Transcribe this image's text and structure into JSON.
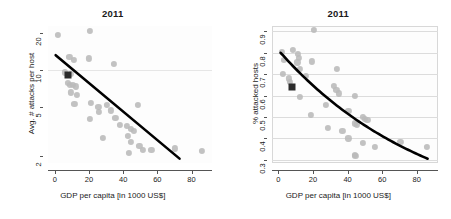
{
  "figure": {
    "width": 451,
    "height": 219,
    "background": "#ffffff",
    "dot_color": "#b9b9b9",
    "highlight_color": "#2b2b2b",
    "trend_color": "#000000",
    "grid_color": "#dcdcdc"
  },
  "chart_data": [
    {
      "type": "scatter",
      "id": "left",
      "title": "2011",
      "xlabel": "GDP per capita [in 1000 US$]",
      "ylabel": "Avg. # attacks per host",
      "xscale": "linear",
      "yscale": "log",
      "xlim": [
        -4,
        92
      ],
      "ylim": [
        1.75,
        23
      ],
      "xticks": [
        0,
        20,
        40,
        60,
        80
      ],
      "xticklabels": [
        "0",
        "20",
        "40",
        "60",
        "80"
      ],
      "yticks": [
        2,
        5,
        10,
        20
      ],
      "yticklabels": [
        "2",
        "5",
        "10",
        "20"
      ],
      "gridlines_y": [
        10
      ],
      "grid": "single horizontal gridline at y=10",
      "legend": null,
      "points": [
        {
          "x": 1.8,
          "y": 19.5
        },
        {
          "x": 20.5,
          "y": 21.0
        },
        {
          "x": 8.5,
          "y": 12.8
        },
        {
          "x": 11.0,
          "y": 12.2
        },
        {
          "x": 20.0,
          "y": 12.5
        },
        {
          "x": 34.5,
          "y": 11.2
        },
        {
          "x": 6.0,
          "y": 9.6
        },
        {
          "x": 9.5,
          "y": 9.3
        },
        {
          "x": 7.5,
          "y": 7.9
        },
        {
          "x": 9.0,
          "y": 7.6
        },
        {
          "x": 10.5,
          "y": 7.6
        },
        {
          "x": 12.5,
          "y": 7.4
        },
        {
          "x": 9.5,
          "y": 6.6
        },
        {
          "x": 13.0,
          "y": 6.3
        },
        {
          "x": 11.5,
          "y": 5.3
        },
        {
          "x": 21.0,
          "y": 5.4
        },
        {
          "x": 25.5,
          "y": 5.0
        },
        {
          "x": 30.5,
          "y": 5.2
        },
        {
          "x": 33.0,
          "y": 4.7
        },
        {
          "x": 48.5,
          "y": 5.2
        },
        {
          "x": 26.0,
          "y": 4.6
        },
        {
          "x": 20.5,
          "y": 4.0
        },
        {
          "x": 35.5,
          "y": 4.1
        },
        {
          "x": 38.0,
          "y": 3.6
        },
        {
          "x": 42.0,
          "y": 3.5
        },
        {
          "x": 44.5,
          "y": 3.3
        },
        {
          "x": 46.5,
          "y": 3.2
        },
        {
          "x": 28.0,
          "y": 2.8
        },
        {
          "x": 43.0,
          "y": 2.9
        },
        {
          "x": 44.5,
          "y": 2.6
        },
        {
          "x": 49.5,
          "y": 2.4
        },
        {
          "x": 43.5,
          "y": 2.1
        },
        {
          "x": 51.5,
          "y": 2.25
        },
        {
          "x": 56.5,
          "y": 2.25
        },
        {
          "x": 70.5,
          "y": 2.3
        },
        {
          "x": 86.0,
          "y": 2.2
        }
      ],
      "highlight_point": {
        "x": 7.8,
        "y": 9.1,
        "shape": "square"
      },
      "trend_line": {
        "shape": "straight-on-log-y",
        "from": {
          "x": 0.5,
          "y": 13.3
        },
        "to": {
          "x": 73.0,
          "y": 1.9
        }
      }
    },
    {
      "type": "scatter",
      "id": "right",
      "title": "2011",
      "xlabel": "GDP per capita [in 1000 US$]",
      "ylabel": "% attacked hosts",
      "xscale": "linear",
      "yscale": "linear",
      "xlim": [
        -4,
        92
      ],
      "ylim": [
        0.285,
        0.925
      ],
      "xticks": [
        0,
        20,
        40,
        60,
        80
      ],
      "xticklabels": [
        "0",
        "20",
        "40",
        "60",
        "80"
      ],
      "yticks": [
        0.3,
        0.4,
        0.5,
        0.6,
        0.7,
        0.8,
        0.9
      ],
      "yticklabels": [
        "0.3",
        "0.4",
        "0.5",
        "0.6",
        "0.7",
        "0.8",
        "0.9"
      ],
      "gridlines_y": [
        0.3,
        0.4,
        0.5,
        0.6,
        0.7,
        0.8,
        0.9
      ],
      "grid": "horizontal gridlines at every y tick",
      "legend": null,
      "points": [
        {
          "x": 20.5,
          "y": 0.905
        },
        {
          "x": 2.0,
          "y": 0.805
        },
        {
          "x": 8.5,
          "y": 0.815
        },
        {
          "x": 11.5,
          "y": 0.795
        },
        {
          "x": 12.0,
          "y": 0.775
        },
        {
          "x": 3.0,
          "y": 0.765
        },
        {
          "x": 11.0,
          "y": 0.755
        },
        {
          "x": 19.5,
          "y": 0.76
        },
        {
          "x": 12.5,
          "y": 0.725
        },
        {
          "x": 34.0,
          "y": 0.725
        },
        {
          "x": 2.5,
          "y": 0.7
        },
        {
          "x": 16.0,
          "y": 0.69
        },
        {
          "x": 6.0,
          "y": 0.68
        },
        {
          "x": 6.5,
          "y": 0.665
        },
        {
          "x": 32.0,
          "y": 0.645
        },
        {
          "x": 33.5,
          "y": 0.625
        },
        {
          "x": 35.0,
          "y": 0.61
        },
        {
          "x": 12.5,
          "y": 0.595
        },
        {
          "x": 44.0,
          "y": 0.598
        },
        {
          "x": 27.5,
          "y": 0.555
        },
        {
          "x": 40.5,
          "y": 0.53
        },
        {
          "x": 19.0,
          "y": 0.51
        },
        {
          "x": 49.0,
          "y": 0.5
        },
        {
          "x": 50.0,
          "y": 0.49
        },
        {
          "x": 51.5,
          "y": 0.488
        },
        {
          "x": 44.0,
          "y": 0.47
        },
        {
          "x": 45.5,
          "y": 0.465
        },
        {
          "x": 28.5,
          "y": 0.448
        },
        {
          "x": 37.0,
          "y": 0.435
        },
        {
          "x": 40.5,
          "y": 0.4
        },
        {
          "x": 49.0,
          "y": 0.38
        },
        {
          "x": 70.5,
          "y": 0.385
        },
        {
          "x": 56.0,
          "y": 0.36
        },
        {
          "x": 86.0,
          "y": 0.36
        },
        {
          "x": 44.0,
          "y": 0.322
        },
        {
          "x": 44.5,
          "y": 0.318
        }
      ],
      "highlight_point": {
        "x": 7.8,
        "y": 0.64,
        "shape": "square"
      },
      "trend_line": {
        "shape": "curve-convex-decreasing",
        "from": {
          "x": 1.0,
          "y": 0.8
        },
        "to": {
          "x": 86.0,
          "y": 0.305
        }
      }
    }
  ]
}
